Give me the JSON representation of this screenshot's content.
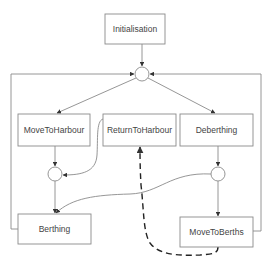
{
  "diagram": {
    "type": "state-machine",
    "colors": {
      "stroke": "#8a8a8a",
      "arrow": "#333333",
      "dashed": "#222222",
      "text": "#444444",
      "background": "#ffffff"
    },
    "nodes": [
      {
        "id": "initialisation",
        "label": "Initialisation",
        "shape": "rect"
      },
      {
        "id": "junction-top",
        "label": "",
        "shape": "circle"
      },
      {
        "id": "move-to-harbour",
        "label": "MoveToHarbour",
        "shape": "rect"
      },
      {
        "id": "return-to-harbour",
        "label": "ReturnToHarbour",
        "shape": "rect"
      },
      {
        "id": "deberthing",
        "label": "Deberthing",
        "shape": "rect"
      },
      {
        "id": "junction-left",
        "label": "",
        "shape": "circle"
      },
      {
        "id": "junction-right",
        "label": "",
        "shape": "circle"
      },
      {
        "id": "berthing",
        "label": "Berthing",
        "shape": "rect"
      },
      {
        "id": "move-to-berths",
        "label": "MoveToBerths",
        "shape": "rect"
      }
    ],
    "edges": [
      {
        "from": "initialisation",
        "to": "junction-top",
        "style": "solid"
      },
      {
        "from": "junction-top",
        "to": "move-to-harbour",
        "style": "solid"
      },
      {
        "from": "junction-top",
        "to": "deberthing",
        "style": "solid"
      },
      {
        "from": "move-to-harbour",
        "to": "junction-left",
        "style": "solid"
      },
      {
        "from": "return-to-harbour",
        "to": "junction-left",
        "style": "solid"
      },
      {
        "from": "junction-left",
        "to": "berthing",
        "style": "solid"
      },
      {
        "from": "deberthing",
        "to": "junction-right",
        "style": "solid"
      },
      {
        "from": "junction-right",
        "to": "berthing",
        "style": "solid"
      },
      {
        "from": "junction-right",
        "to": "move-to-berths",
        "style": "solid"
      },
      {
        "from": "move-to-berths",
        "to": "return-to-harbour",
        "style": "dashed"
      },
      {
        "from": "berthing",
        "to": "junction-top",
        "style": "solid"
      },
      {
        "from": "move-to-berths",
        "to": "junction-top",
        "style": "solid"
      }
    ]
  }
}
